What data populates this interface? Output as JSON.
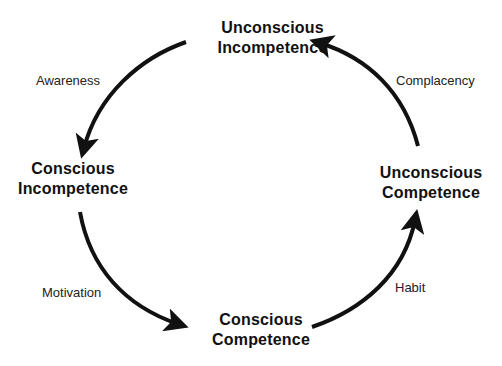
{
  "diagram": {
    "title": "",
    "type": "cycle",
    "colors": {
      "background": "#ffffff",
      "text": "#111111",
      "arrow": "#111111"
    },
    "stages": [
      {
        "id": "top",
        "line1": "Unconscious",
        "line2": "Incompetence"
      },
      {
        "id": "left",
        "line1": "Conscious",
        "line2": "Incompetence"
      },
      {
        "id": "bottom",
        "line1": "Conscious",
        "line2": "Competence"
      },
      {
        "id": "right",
        "line1": "Unconscious",
        "line2": "Competence"
      }
    ],
    "transitions": [
      {
        "from": "top",
        "to": "left",
        "label": "Awareness"
      },
      {
        "from": "left",
        "to": "bottom",
        "label": "Motivation"
      },
      {
        "from": "bottom",
        "to": "right",
        "label": "Habit"
      },
      {
        "from": "right",
        "to": "top",
        "label": "Complacency"
      }
    ]
  }
}
